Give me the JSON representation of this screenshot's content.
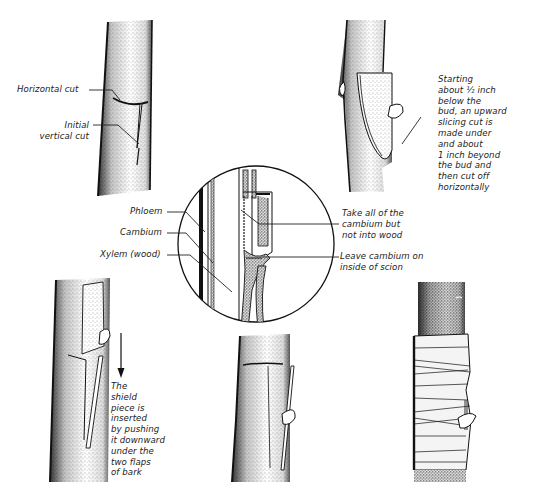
{
  "diagram": {
    "panels": [
      {
        "id": "step-1-cut-stock",
        "position": "top-left"
      },
      {
        "id": "step-2-cut-bud",
        "position": "top-right"
      },
      {
        "id": "detail-cross-section",
        "position": "center"
      },
      {
        "id": "step-3-insert-shield",
        "position": "bottom-left"
      },
      {
        "id": "step-4-inserted",
        "position": "bottom-center"
      },
      {
        "id": "step-5-wrapped",
        "position": "bottom-right"
      }
    ],
    "colors": {
      "ink": "#1a1a1a",
      "paper": "#ffffff",
      "stipple": "#555555"
    }
  },
  "labels": {
    "horizontal_cut": "Horizontal cut",
    "initial_vertical_cut": [
      "Initial",
      "vertical cut"
    ],
    "starting_note": [
      "Starting",
      "about ½ inch",
      "below the",
      "bud, an upward",
      "slicing cut is",
      "made under",
      "and about",
      "1 inch beyond",
      "the bud and",
      "then cut off",
      "horizontally"
    ],
    "phloem": "Phloem",
    "cambium": "Cambium",
    "xylem": "Xylem (wood)",
    "take_all_cambium": [
      "Take all of the",
      "cambium but",
      "not into wood"
    ],
    "leave_cambium": [
      "Leave cambium on",
      "inside of scion"
    ],
    "shield_note": [
      "The",
      "shield",
      "piece is",
      "inserted",
      "by pushing",
      "it downward",
      "under the",
      "two flaps",
      "of bark"
    ]
  }
}
